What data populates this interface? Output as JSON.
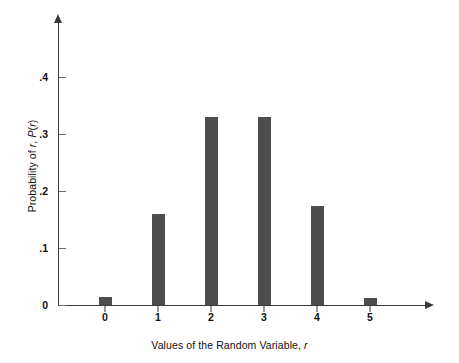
{
  "chart_data": {
    "type": "bar",
    "title": "",
    "xlabel": "Values of the Random Variable, r",
    "ylabel": "Probability of r, P(r)",
    "categories": [
      "0",
      "1",
      "2",
      "3",
      "4",
      "5"
    ],
    "values": [
      0.014,
      0.16,
      0.33,
      0.33,
      0.173,
      0.012
    ],
    "series": [
      {
        "name": "P(r)",
        "values": [
          0.014,
          0.16,
          0.33,
          0.33,
          0.173,
          0.012
        ]
      }
    ],
    "x": [
      0,
      1,
      2,
      3,
      4,
      5
    ],
    "ylim": [
      0,
      0.47
    ],
    "xlim": [
      -0.5,
      6.4
    ],
    "ytick_values": [
      0,
      0.1,
      0.2,
      0.3,
      0.4
    ],
    "ytick_labels": [
      "0",
      ".1",
      ".2",
      ".3",
      ".4"
    ],
    "xtick_labels": [
      "0",
      "1",
      "2",
      "3",
      "4",
      "5"
    ],
    "grid": false,
    "legend": "none",
    "bar_color": "#4d4d4d",
    "axis_color": "#3a3a3a",
    "background_color": "#ffffff"
  },
  "axes": {
    "y_label_prefix": "Probability of ",
    "y_label_var1": "r",
    "y_label_mid": ", ",
    "y_label_func": "P",
    "y_label_open": "(",
    "y_label_var2": "r",
    "y_label_close": ")",
    "x_label_prefix": "Values of the Random Variable, ",
    "x_label_var": "r"
  },
  "ytick_labels": {
    "t0": "0",
    "t1": ".1",
    "t2": ".2",
    "t3": ".3",
    "t4": ".4"
  },
  "xtick_labels": {
    "c0": "0",
    "c1": "1",
    "c2": "2",
    "c3": "3",
    "c4": "4",
    "c5": "5"
  }
}
